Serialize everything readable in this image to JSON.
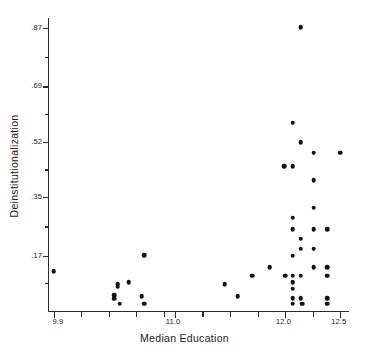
{
  "chart_data": {
    "type": "scatter",
    "title": "",
    "xlabel": "Median Education",
    "ylabel": "Deinstitutionalization",
    "xlim": [
      9.85,
      12.57
    ],
    "ylim": [
      0.0,
      0.9
    ],
    "grid": false,
    "legend": null,
    "xticks": [
      {
        "value": 9.9,
        "label": "9.9",
        "major": true
      },
      {
        "value": 10.15,
        "label": "",
        "major": false
      },
      {
        "value": 10.4,
        "label": "",
        "major": false
      },
      {
        "value": 10.65,
        "label": "",
        "major": false
      },
      {
        "value": 10.9,
        "label": "",
        "major": false
      },
      {
        "value": 11.0,
        "label": "11.0",
        "major": true
      },
      {
        "value": 11.25,
        "label": "",
        "major": false
      },
      {
        "value": 11.5,
        "label": "",
        "major": false
      },
      {
        "value": 11.75,
        "label": "",
        "major": false
      },
      {
        "value": 12.0,
        "label": "12.0",
        "major": true
      },
      {
        "value": 12.25,
        "label": "",
        "major": false
      },
      {
        "value": 12.5,
        "label": "12.5",
        "major": true
      }
    ],
    "yticks": [
      {
        "value": 0.17,
        "label": ".17",
        "major": true
      },
      {
        "value": 0.26,
        "label": "",
        "major": false
      },
      {
        "value": 0.35,
        "label": ".35",
        "major": true
      },
      {
        "value": 0.435,
        "label": "",
        "major": false
      },
      {
        "value": 0.52,
        "label": ".52",
        "major": true
      },
      {
        "value": 0.605,
        "label": "",
        "major": false
      },
      {
        "value": 0.69,
        "label": ".69",
        "major": true
      },
      {
        "value": 0.78,
        "label": "",
        "major": false
      },
      {
        "value": 0.87,
        "label": ".87",
        "major": true
      },
      {
        "value": 0.085,
        "label": "",
        "major": false
      }
    ],
    "points": [
      {
        "x": 9.9,
        "y": 0.122
      },
      {
        "x": 10.45,
        "y": 0.048
      },
      {
        "x": 10.45,
        "y": 0.038
      },
      {
        "x": 10.48,
        "y": 0.082
      },
      {
        "x": 10.48,
        "y": 0.075
      },
      {
        "x": 10.5,
        "y": 0.022
      },
      {
        "x": 10.58,
        "y": 0.088
      },
      {
        "x": 10.72,
        "y": 0.172
      },
      {
        "x": 10.7,
        "y": 0.046
      },
      {
        "x": 10.72,
        "y": 0.022
      },
      {
        "x": 11.45,
        "y": 0.082
      },
      {
        "x": 11.57,
        "y": 0.046
      },
      {
        "x": 11.7,
        "y": 0.108
      },
      {
        "x": 11.86,
        "y": 0.135
      },
      {
        "x": 11.99,
        "y": 0.445
      },
      {
        "x": 12.0,
        "y": 0.108
      },
      {
        "x": 12.07,
        "y": 0.578
      },
      {
        "x": 12.07,
        "y": 0.445
      },
      {
        "x": 12.07,
        "y": 0.287
      },
      {
        "x": 12.07,
        "y": 0.252
      },
      {
        "x": 12.07,
        "y": 0.17
      },
      {
        "x": 12.07,
        "y": 0.108
      },
      {
        "x": 12.07,
        "y": 0.088
      },
      {
        "x": 12.07,
        "y": 0.068
      },
      {
        "x": 12.07,
        "y": 0.04
      },
      {
        "x": 12.07,
        "y": 0.022
      },
      {
        "x": 12.14,
        "y": 0.872
      },
      {
        "x": 12.14,
        "y": 0.518
      },
      {
        "x": 12.14,
        "y": 0.222
      },
      {
        "x": 12.14,
        "y": 0.192
      },
      {
        "x": 12.14,
        "y": 0.108
      },
      {
        "x": 12.14,
        "y": 0.04
      },
      {
        "x": 12.15,
        "y": 0.022
      },
      {
        "x": 12.16,
        "y": 0.022
      },
      {
        "x": 12.26,
        "y": 0.487
      },
      {
        "x": 12.26,
        "y": 0.402
      },
      {
        "x": 12.26,
        "y": 0.318
      },
      {
        "x": 12.26,
        "y": 0.252
      },
      {
        "x": 12.26,
        "y": 0.192
      },
      {
        "x": 12.26,
        "y": 0.135
      },
      {
        "x": 12.38,
        "y": 0.252
      },
      {
        "x": 12.38,
        "y": 0.135
      },
      {
        "x": 12.38,
        "y": 0.108
      },
      {
        "x": 12.38,
        "y": 0.04
      },
      {
        "x": 12.38,
        "y": 0.022
      },
      {
        "x": 12.5,
        "y": 0.487
      }
    ],
    "n_points": 46,
    "marker": {
      "shape": "circle",
      "color": "#111111",
      "size_px": 4.6
    },
    "axis_color": "#2b2b2b",
    "background_color": "#ffffff"
  }
}
